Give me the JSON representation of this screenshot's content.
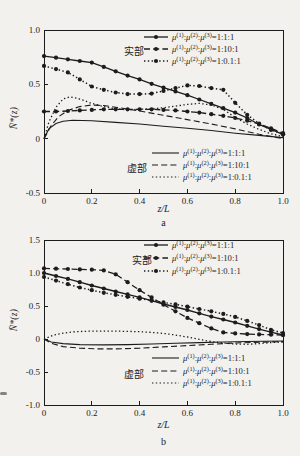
{
  "style": {
    "background": "#f2f1ee",
    "ink": "#1c1c1c"
  },
  "chart_data": [
    {
      "type": "line",
      "sublabel": "a",
      "xlabel": "z/L",
      "ylabel": "N̄*(z)",
      "xlim": [
        0,
        1
      ],
      "ylim": [
        -0.5,
        1.0
      ],
      "xticks": [
        {
          "label": "0",
          "value": 0
        },
        {
          "label": "0.2",
          "value": 0.2
        },
        {
          "label": "0.4",
          "value": 0.4
        },
        {
          "label": "0.6",
          "value": 0.6
        },
        {
          "label": "0.8",
          "value": 0.8
        },
        {
          "label": "1.0",
          "value": 1.0
        }
      ],
      "yticks": [
        {
          "label": "1.0",
          "value": 1.0
        },
        {
          "label": "0.5",
          "value": 0.5
        },
        {
          "label": "0",
          "value": 0
        },
        {
          "label": "-0.5",
          "value": -0.5
        }
      ],
      "groups": {
        "real": "实部",
        "imag": "虚部"
      },
      "series": [
        {
          "id": "real-1-1-1",
          "group": "real",
          "label": "μ(1):μ(2):μ(3)=1:1:1",
          "line": "solid",
          "markers": true,
          "points": [
            [
              0,
              0.76
            ],
            [
              0.05,
              0.745
            ],
            [
              0.1,
              0.73
            ],
            [
              0.15,
              0.715
            ],
            [
              0.2,
              0.7
            ],
            [
              0.25,
              0.66
            ],
            [
              0.3,
              0.62
            ],
            [
              0.35,
              0.58
            ],
            [
              0.4,
              0.545
            ],
            [
              0.45,
              0.505
            ],
            [
              0.5,
              0.47
            ],
            [
              0.55,
              0.435
            ],
            [
              0.6,
              0.4
            ],
            [
              0.65,
              0.36
            ],
            [
              0.7,
              0.32
            ],
            [
              0.75,
              0.28
            ],
            [
              0.8,
              0.24
            ],
            [
              0.85,
              0.19
            ],
            [
              0.9,
              0.13
            ],
            [
              0.95,
              0.085
            ],
            [
              1,
              0.04
            ]
          ]
        },
        {
          "id": "real-1-10-1",
          "group": "real",
          "label": "μ(1):μ(2):μ(3)=1:10:1",
          "line": "dashed",
          "markers": true,
          "points": [
            [
              0,
              0.25
            ],
            [
              0.05,
              0.25
            ],
            [
              0.1,
              0.255
            ],
            [
              0.15,
              0.26
            ],
            [
              0.2,
              0.265
            ],
            [
              0.25,
              0.27
            ],
            [
              0.3,
              0.27
            ],
            [
              0.35,
              0.27
            ],
            [
              0.4,
              0.27
            ],
            [
              0.45,
              0.27
            ],
            [
              0.5,
              0.265
            ],
            [
              0.55,
              0.26
            ],
            [
              0.6,
              0.25
            ],
            [
              0.65,
              0.24
            ],
            [
              0.7,
              0.225
            ],
            [
              0.75,
              0.21
            ],
            [
              0.8,
              0.19
            ],
            [
              0.85,
              0.165
            ],
            [
              0.9,
              0.135
            ],
            [
              0.95,
              0.095
            ],
            [
              1,
              0.05
            ]
          ]
        },
        {
          "id": "real-1-0.1-1",
          "group": "real",
          "label": "μ(1):μ(2):μ(3)=1:0.1:1",
          "line": "dotted",
          "markers": true,
          "points": [
            [
              0,
              0.67
            ],
            [
              0.05,
              0.64
            ],
            [
              0.1,
              0.61
            ],
            [
              0.15,
              0.545
            ],
            [
              0.2,
              0.48
            ],
            [
              0.25,
              0.45
            ],
            [
              0.3,
              0.425
            ],
            [
              0.35,
              0.41
            ],
            [
              0.4,
              0.41
            ],
            [
              0.45,
              0.415
            ],
            [
              0.5,
              0.44
            ],
            [
              0.55,
              0.465
            ],
            [
              0.6,
              0.49
            ],
            [
              0.65,
              0.485
            ],
            [
              0.7,
              0.465
            ],
            [
              0.75,
              0.45
            ],
            [
              0.8,
              0.33
            ],
            [
              0.85,
              0.22
            ],
            [
              0.9,
              0.14
            ],
            [
              0.95,
              0.08
            ],
            [
              1,
              0.04
            ]
          ]
        },
        {
          "id": "imag-1-1-1",
          "group": "imag",
          "label": "μ(1):μ(2):μ(3)=1:1:1",
          "line": "solid",
          "markers": false,
          "points": [
            [
              0,
              0
            ],
            [
              0.02,
              0.09
            ],
            [
              0.05,
              0.14
            ],
            [
              0.08,
              0.16
            ],
            [
              0.12,
              0.17
            ],
            [
              0.2,
              0.165
            ],
            [
              0.3,
              0.15
            ],
            [
              0.4,
              0.135
            ],
            [
              0.5,
              0.115
            ],
            [
              0.6,
              0.095
            ],
            [
              0.7,
              0.075
            ],
            [
              0.8,
              0.05
            ],
            [
              0.9,
              0.03
            ],
            [
              1,
              0.01
            ]
          ]
        },
        {
          "id": "imag-1-10-1",
          "group": "imag",
          "label": "μ(1):μ(2):μ(3)=1:10:1",
          "line": "dashed",
          "markers": false,
          "points": [
            [
              0,
              0
            ],
            [
              0.03,
              0.12
            ],
            [
              0.06,
              0.2
            ],
            [
              0.1,
              0.26
            ],
            [
              0.15,
              0.295
            ],
            [
              0.2,
              0.31
            ],
            [
              0.25,
              0.305
            ],
            [
              0.3,
              0.29
            ],
            [
              0.4,
              0.255
            ],
            [
              0.5,
              0.215
            ],
            [
              0.6,
              0.175
            ],
            [
              0.7,
              0.135
            ],
            [
              0.8,
              0.09
            ],
            [
              0.9,
              0.04
            ],
            [
              1,
              0
            ]
          ]
        },
        {
          "id": "imag-1-0.1-1",
          "group": "imag",
          "label": "μ(1):μ(2):μ(3)=1:0.1:1",
          "line": "dotted",
          "markers": false,
          "points": [
            [
              0,
              0
            ],
            [
              0.02,
              0.15
            ],
            [
              0.05,
              0.29
            ],
            [
              0.08,
              0.365
            ],
            [
              0.11,
              0.385
            ],
            [
              0.15,
              0.365
            ],
            [
              0.2,
              0.325
            ],
            [
              0.25,
              0.295
            ],
            [
              0.3,
              0.275
            ],
            [
              0.35,
              0.265
            ],
            [
              0.4,
              0.27
            ],
            [
              0.45,
              0.275
            ],
            [
              0.5,
              0.285
            ],
            [
              0.55,
              0.3
            ],
            [
              0.6,
              0.315
            ],
            [
              0.65,
              0.325
            ],
            [
              0.7,
              0.31
            ],
            [
              0.75,
              0.27
            ],
            [
              0.8,
              0.195
            ],
            [
              0.85,
              0.135
            ],
            [
              0.9,
              0.085
            ],
            [
              0.95,
              0.045
            ],
            [
              1,
              0.02
            ]
          ]
        }
      ]
    },
    {
      "type": "line",
      "sublabel": "b",
      "xlabel": "z/L",
      "ylabel": "N̄*(z)",
      "xlim": [
        0,
        1
      ],
      "ylim": [
        -1.0,
        1.5
      ],
      "xticks": [
        {
          "label": "0",
          "value": 0
        },
        {
          "label": "0.2",
          "value": 0.2
        },
        {
          "label": "0.4",
          "value": 0.4
        },
        {
          "label": "0.6",
          "value": 0.6
        },
        {
          "label": "0.8",
          "value": 0.8
        },
        {
          "label": "1.0",
          "value": 1.0
        }
      ],
      "yticks": [
        {
          "label": "1.5",
          "value": 1.5
        },
        {
          "label": "1.0",
          "value": 1.0
        },
        {
          "label": "0.5",
          "value": 0.5
        },
        {
          "label": "0",
          "value": 0
        },
        {
          "label": "-0.5",
          "value": -0.5
        },
        {
          "label": "-1.0",
          "value": -1.0
        }
      ],
      "groups": {
        "real": "实部",
        "imag": "虚部"
      },
      "series": [
        {
          "id": "real-1-1-1",
          "group": "real",
          "label": "μ(1):μ(2):μ(3)=1:1:1",
          "line": "solid",
          "markers": true,
          "points": [
            [
              0,
              1.0
            ],
            [
              0.05,
              0.955
            ],
            [
              0.1,
              0.91
            ],
            [
              0.15,
              0.86
            ],
            [
              0.2,
              0.81
            ],
            [
              0.25,
              0.765
            ],
            [
              0.3,
              0.72
            ],
            [
              0.35,
              0.675
            ],
            [
              0.4,
              0.63
            ],
            [
              0.45,
              0.58
            ],
            [
              0.5,
              0.53
            ],
            [
              0.55,
              0.485
            ],
            [
              0.6,
              0.44
            ],
            [
              0.65,
              0.39
            ],
            [
              0.7,
              0.34
            ],
            [
              0.75,
              0.295
            ],
            [
              0.8,
              0.25
            ],
            [
              0.85,
              0.2
            ],
            [
              0.9,
              0.15
            ],
            [
              0.95,
              0.105
            ],
            [
              1,
              0.06
            ]
          ]
        },
        {
          "id": "real-1-10-1",
          "group": "real",
          "label": "μ(1):μ(2):μ(3)=1:10:1",
          "line": "dashed",
          "markers": true,
          "points": [
            [
              0,
              1.07
            ],
            [
              0.05,
              1.065
            ],
            [
              0.1,
              1.06
            ],
            [
              0.15,
              1.055
            ],
            [
              0.2,
              1.05
            ],
            [
              0.25,
              1.04
            ],
            [
              0.3,
              0.98
            ],
            [
              0.35,
              0.86
            ],
            [
              0.4,
              0.74
            ],
            [
              0.45,
              0.63
            ],
            [
              0.5,
              0.52
            ],
            [
              0.55,
              0.42
            ],
            [
              0.6,
              0.32
            ],
            [
              0.65,
              0.24
            ],
            [
              0.7,
              0.16
            ],
            [
              0.75,
              0.1
            ],
            [
              0.8,
              0.085
            ],
            [
              0.85,
              0.075
            ],
            [
              0.9,
              0.07
            ],
            [
              0.95,
              0.065
            ],
            [
              1,
              0.06
            ]
          ]
        },
        {
          "id": "real-1-0.1-1",
          "group": "real",
          "label": "μ(1):μ(2):μ(3)=1:0.1:1",
          "line": "dotted",
          "markers": true,
          "points": [
            [
              0,
              0.94
            ],
            [
              0.05,
              0.885
            ],
            [
              0.1,
              0.83
            ],
            [
              0.15,
              0.78
            ],
            [
              0.2,
              0.74
            ],
            [
              0.25,
              0.7
            ],
            [
              0.3,
              0.67
            ],
            [
              0.35,
              0.64
            ],
            [
              0.4,
              0.61
            ],
            [
              0.45,
              0.585
            ],
            [
              0.5,
              0.555
            ],
            [
              0.55,
              0.525
            ],
            [
              0.6,
              0.49
            ],
            [
              0.65,
              0.455
            ],
            [
              0.7,
              0.42
            ],
            [
              0.75,
              0.38
            ],
            [
              0.8,
              0.335
            ],
            [
              0.85,
              0.275
            ],
            [
              0.9,
              0.21
            ],
            [
              0.95,
              0.14
            ],
            [
              1,
              0.09
            ]
          ]
        },
        {
          "id": "imag-1-1-1",
          "group": "imag",
          "label": "μ(1):μ(2):μ(3)=1:1:1",
          "line": "solid",
          "markers": false,
          "points": [
            [
              0,
              0
            ],
            [
              0.03,
              -0.045
            ],
            [
              0.08,
              -0.07
            ],
            [
              0.15,
              -0.085
            ],
            [
              0.25,
              -0.09
            ],
            [
              0.35,
              -0.085
            ],
            [
              0.45,
              -0.075
            ],
            [
              0.55,
              -0.065
            ],
            [
              0.65,
              -0.055
            ],
            [
              0.75,
              -0.045
            ],
            [
              0.85,
              -0.038
            ],
            [
              1,
              -0.03
            ]
          ]
        },
        {
          "id": "imag-1-10-1",
          "group": "imag",
          "label": "μ(1):μ(2):μ(3)=1:10:1",
          "line": "dashed",
          "markers": false,
          "points": [
            [
              0,
              0
            ],
            [
              0.03,
              -0.065
            ],
            [
              0.08,
              -0.115
            ],
            [
              0.15,
              -0.14
            ],
            [
              0.22,
              -0.15
            ],
            [
              0.3,
              -0.15
            ],
            [
              0.4,
              -0.14
            ],
            [
              0.5,
              -0.12
            ],
            [
              0.6,
              -0.1
            ],
            [
              0.7,
              -0.08
            ],
            [
              0.8,
              -0.06
            ],
            [
              0.9,
              -0.048
            ],
            [
              1,
              -0.04
            ]
          ]
        },
        {
          "id": "imag-1-0.1-1",
          "group": "imag",
          "label": "μ(1):μ(2):μ(3)=1:0.1:1",
          "line": "dotted",
          "markers": false,
          "points": [
            [
              0,
              0
            ],
            [
              0.04,
              0.06
            ],
            [
              0.08,
              0.09
            ],
            [
              0.13,
              0.11
            ],
            [
              0.2,
              0.12
            ],
            [
              0.3,
              0.12
            ],
            [
              0.4,
              0.11
            ],
            [
              0.45,
              0.1
            ],
            [
              0.5,
              0.085
            ],
            [
              0.55,
              0.06
            ],
            [
              0.6,
              0.03
            ],
            [
              0.65,
              -0.005
            ],
            [
              0.7,
              -0.04
            ],
            [
              0.75,
              -0.06
            ],
            [
              0.8,
              -0.075
            ],
            [
              0.85,
              -0.08
            ],
            [
              0.9,
              -0.07
            ],
            [
              0.95,
              -0.055
            ],
            [
              1,
              -0.045
            ]
          ]
        }
      ]
    }
  ]
}
